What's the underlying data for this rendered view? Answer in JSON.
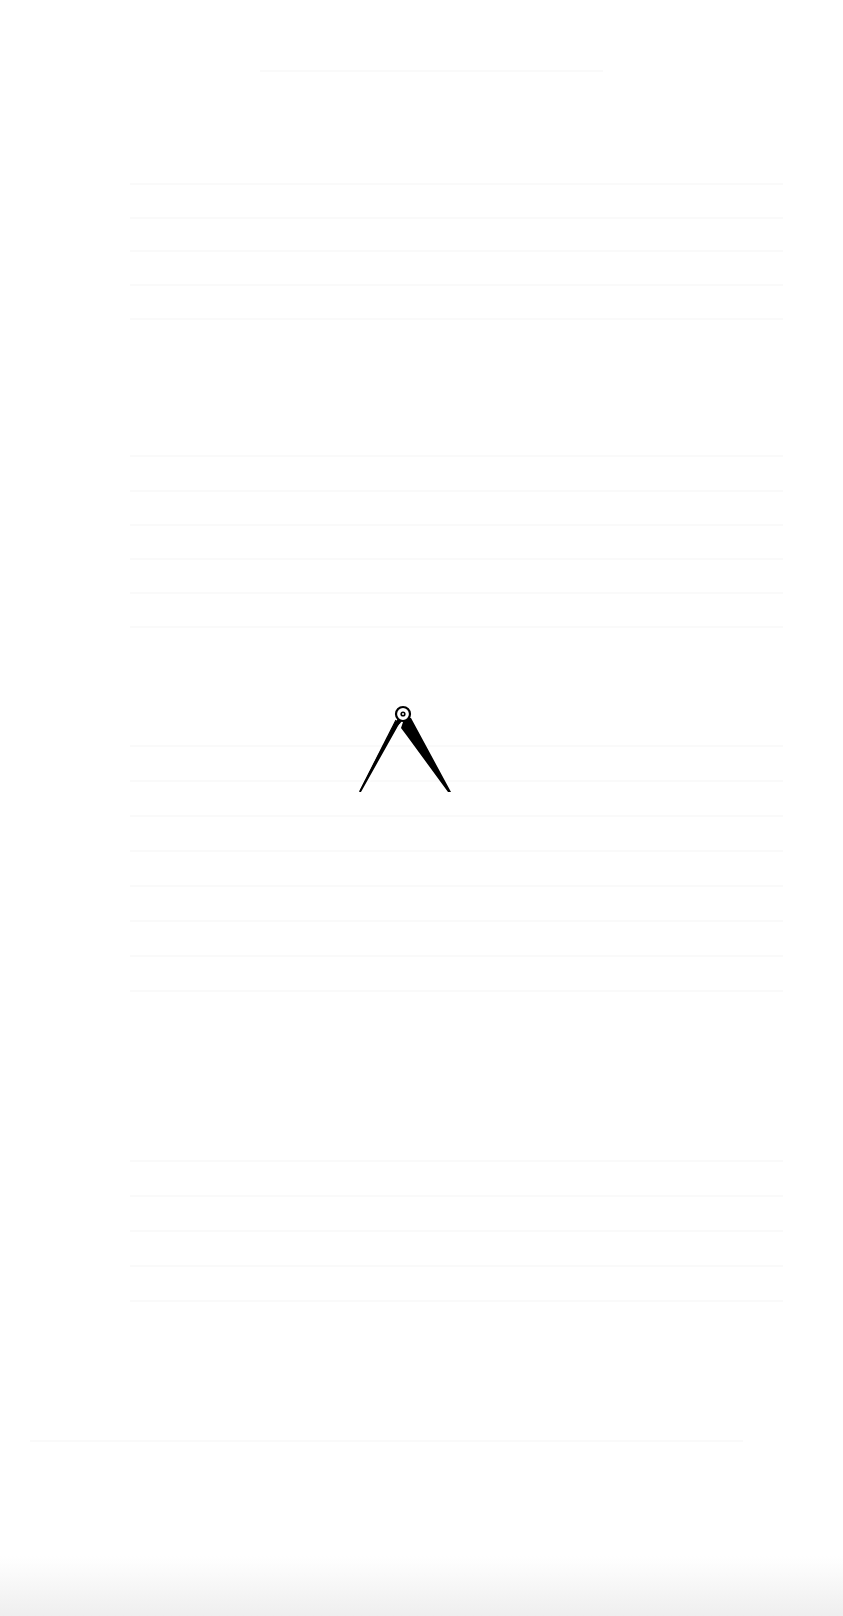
{
  "page": {
    "type": "scanned-book-page",
    "background_color": "#ffffff",
    "ornament": {
      "icon": "dividers-compass-icon",
      "color": "#000000"
    },
    "bleed_through_text_visible": false,
    "scan_edge_color": "#e1e1e1"
  }
}
